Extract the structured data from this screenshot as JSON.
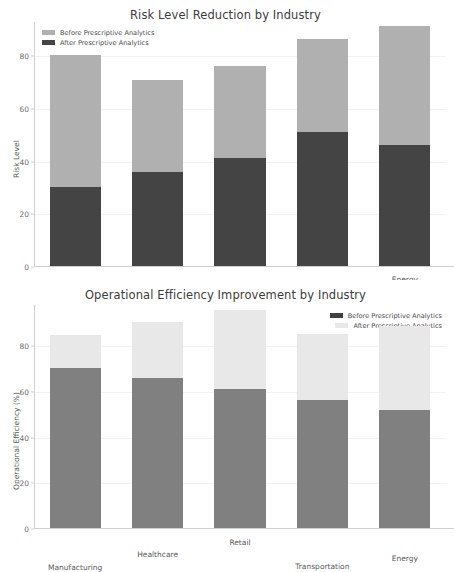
{
  "figure": {
    "background": "#ffffff"
  },
  "colors": {
    "risk_before": "#b0b0b0",
    "risk_after": "#444444",
    "eff_before": "#808080",
    "eff_after": "#e8e8e8",
    "axis": "#cfcfcf",
    "grid": "#f2f2f2",
    "text": "#5a5a5a",
    "title": "#3c3c3c"
  },
  "charts": [
    {
      "id": "risk-level",
      "title": "Risk Level Reduction by Industry",
      "ylabel": "Risk Level",
      "legend": [
        {
          "label": "Before Prescriptive Analytics",
          "color": "#b0b0b0"
        },
        {
          "label": "After Prescriptive Analytics",
          "color": "#444444"
        }
      ],
      "legend_position": "upper left",
      "yticks": [
        "0",
        "20",
        "40",
        "60",
        "80"
      ]
    },
    {
      "id": "op-efficiency",
      "title": "Operational Efficiency Improvement by Industry",
      "ylabel": "Operational Efficiency (%)",
      "legend": [
        {
          "label": "Before Prescriptive Analytics",
          "color": "#808080"
        },
        {
          "label": "After Prescriptive Analytics",
          "color": "#e8e8e8"
        }
      ],
      "legend_position": "upper right",
      "yticks": [
        "0",
        "20",
        "40",
        "60",
        "80"
      ]
    }
  ],
  "chart_data": [
    {
      "type": "bar",
      "stacked": true,
      "title": "Risk Level Reduction by Industry",
      "xlabel": "",
      "ylabel": "Risk Level",
      "ylim": [
        0,
        93
      ],
      "yticks": [
        0,
        20,
        40,
        60,
        80
      ],
      "grid": true,
      "legend": [
        "Before Prescriptive Analytics",
        "After Prescriptive Analytics"
      ],
      "legend_position": "upper left",
      "categories": [
        "Manufacturing",
        "Healthcare",
        "Retail",
        "Transportation",
        "Energy"
      ],
      "series": [
        {
          "name": "After Prescriptive Analytics",
          "color": "#444444",
          "values": [
            30,
            35.5,
            41,
            51,
            46
          ]
        },
        {
          "name": "Before Prescriptive Analytics",
          "color": "#b0b0b0",
          "values": [
            80,
            70.5,
            76,
            86,
            91
          ]
        }
      ]
    },
    {
      "type": "bar",
      "stacked": true,
      "title": "Operational Efficiency Improvement by Industry",
      "xlabel": "",
      "ylabel": "Operational Efficiency (%)",
      "ylim": [
        0,
        98
      ],
      "yticks": [
        0,
        20,
        40,
        60,
        80
      ],
      "grid": true,
      "legend": [
        "Before Prescriptive Analytics",
        "After Prescriptive Analytics"
      ],
      "legend_position": "upper right",
      "categories": [
        "Manufacturing",
        "Healthcare",
        "Retail",
        "Transportation",
        "Energy"
      ],
      "series": [
        {
          "name": "Before Prescriptive Analytics",
          "color": "#808080",
          "values": [
            70,
            65.5,
            61,
            56,
            51.5
          ]
        },
        {
          "name": "After Prescriptive Analytics",
          "color": "#e8e8e8",
          "values": [
            84.5,
            90,
            95.5,
            85,
            88.5
          ]
        }
      ]
    }
  ]
}
